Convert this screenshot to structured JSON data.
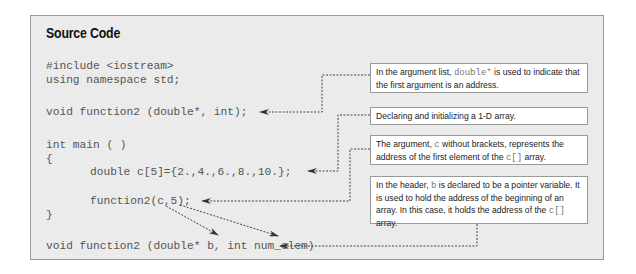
{
  "panel": {
    "title": "Source Code"
  },
  "code_lines": [
    {
      "text": "#include <iostream>",
      "x": 46,
      "y": 60
    },
    {
      "text": "using namespace std;",
      "x": 46,
      "y": 74
    },
    {
      "text": "void function2 (double*, int);",
      "x": 46,
      "y": 106
    },
    {
      "text": "int main ( )",
      "x": 46,
      "y": 139
    },
    {
      "text": "{",
      "x": 46,
      "y": 153
    },
    {
      "text": "double c[5]={2.,4.,6.,8.,10.};",
      "x": 90,
      "y": 166
    },
    {
      "text": "function2(c,5);",
      "x": 90,
      "y": 195
    },
    {
      "text": "}",
      "x": 46,
      "y": 209
    },
    {
      "text": "void function2 (double* b, int num_elem)",
      "x": 46,
      "y": 240
    }
  ],
  "annotations": [
    {
      "id": "note-1",
      "parts": [
        {
          "t": "In the argument list, "
        },
        {
          "t": "double*",
          "mono": true
        },
        {
          "t": " is used to indicate that the first argument is an address."
        }
      ]
    },
    {
      "id": "note-2",
      "parts": [
        {
          "t": "Declaring and initializing a 1-D array."
        }
      ]
    },
    {
      "id": "note-3",
      "parts": [
        {
          "t": "The argument, "
        },
        {
          "t": "c",
          "mono": true
        },
        {
          "t": " without brackets, represents the address of the first element of the "
        },
        {
          "t": "c[]",
          "mono": true
        },
        {
          "t": " array."
        }
      ]
    },
    {
      "id": "note-4",
      "parts": [
        {
          "t": "In the header, "
        },
        {
          "t": "b",
          "mono": true
        },
        {
          "t": " is declared to be a pointer variable. It is used to hold the address of the beginning of an array. In this case, it holds the address of the "
        },
        {
          "t": "c[]",
          "mono": true
        },
        {
          "t": " array."
        }
      ]
    }
  ],
  "colors": {
    "panel_bg": "#ebebeb",
    "panel_border": "#9a9a9a",
    "code_text": "#555555",
    "connector": "#333333",
    "note_bg": "#ffffff"
  }
}
